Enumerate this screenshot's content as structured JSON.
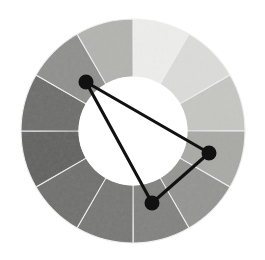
{
  "figure": {
    "name": "grayscale-color-wheel-with-harmony-triangle",
    "background_color": "#ffffff",
    "geometry": {
      "center_x": 133,
      "center_y": 131,
      "outer_radius": 112,
      "inner_radius": 54,
      "segment_count": 12,
      "segment_span_degrees": 30,
      "first_boundary_degrees": 0,
      "separator_color": "#f2f2f2"
    },
    "wheel": {
      "label": "color-wheel",
      "segments": [
        {
          "index": 1,
          "position": "12-1 o'clock",
          "start_deg": 0,
          "end_deg": 30,
          "color": "#eeeeec",
          "tone": "lightest"
        },
        {
          "index": 2,
          "position": "1-2 o'clock",
          "start_deg": 30,
          "end_deg": 60,
          "color": "#dcdcda",
          "tone": "very-light"
        },
        {
          "index": 3,
          "position": "2-3 o'clock",
          "start_deg": 60,
          "end_deg": 90,
          "color": "#c6c6c3",
          "tone": "light"
        },
        {
          "index": 4,
          "position": "3-4 o'clock",
          "start_deg": 90,
          "end_deg": 120,
          "color": "#a9a9a6",
          "tone": "light-medium"
        },
        {
          "index": 5,
          "position": "4-5 o'clock",
          "start_deg": 120,
          "end_deg": 150,
          "color": "#949491",
          "tone": "medium"
        },
        {
          "index": 6,
          "position": "5-6 o'clock",
          "start_deg": 150,
          "end_deg": 180,
          "color": "#818180",
          "tone": "medium-dark"
        },
        {
          "index": 7,
          "position": "6-7 o'clock",
          "start_deg": 180,
          "end_deg": 210,
          "color": "#767675",
          "tone": "medium-dark"
        },
        {
          "index": 8,
          "position": "7-8 o'clock",
          "start_deg": 210,
          "end_deg": 240,
          "color": "#6e6e6d",
          "tone": "dark"
        },
        {
          "index": 9,
          "position": "8-9 o'clock",
          "start_deg": 240,
          "end_deg": 270,
          "color": "#5f5f5e",
          "tone": "darkest"
        },
        {
          "index": 10,
          "position": "9-10 o'clock",
          "start_deg": 270,
          "end_deg": 300,
          "color": "#6b6b6a",
          "tone": "dark"
        },
        {
          "index": 11,
          "position": "10-11 o'clock",
          "start_deg": 300,
          "end_deg": 330,
          "color": "#8f8f8d",
          "tone": "medium"
        },
        {
          "index": 12,
          "position": "11-12 o'clock",
          "start_deg": 330,
          "end_deg": 360,
          "color": "#b3b3b0",
          "tone": "light-medium"
        }
      ]
    },
    "harmony": {
      "label": "triangle-harmony-selector",
      "shape": "triangle",
      "stroke_color": "#111111",
      "node_color": "#111111",
      "node_radius": 7.5,
      "edge_width": 3.1,
      "nodes": [
        {
          "id": "node-upper-left",
          "name": "harmony-node-upper-left",
          "x": 86,
          "y": 82,
          "angle_deg": 318,
          "segment_index": 11
        },
        {
          "id": "node-right",
          "name": "harmony-node-right",
          "x": 209,
          "y": 153,
          "angle_deg": 100,
          "segment_index": 4
        },
        {
          "id": "node-bottom",
          "name": "harmony-node-bottom",
          "x": 152,
          "y": 203,
          "angle_deg": 185,
          "segment_index": 7
        }
      ],
      "edges": [
        {
          "id": "edge-upper-left-to-right",
          "from": "node-upper-left",
          "to": "node-right"
        },
        {
          "id": "edge-right-to-bottom",
          "from": "node-right",
          "to": "node-bottom"
        },
        {
          "id": "edge-bottom-to-upper-left",
          "from": "node-bottom",
          "to": "node-upper-left"
        }
      ]
    }
  }
}
